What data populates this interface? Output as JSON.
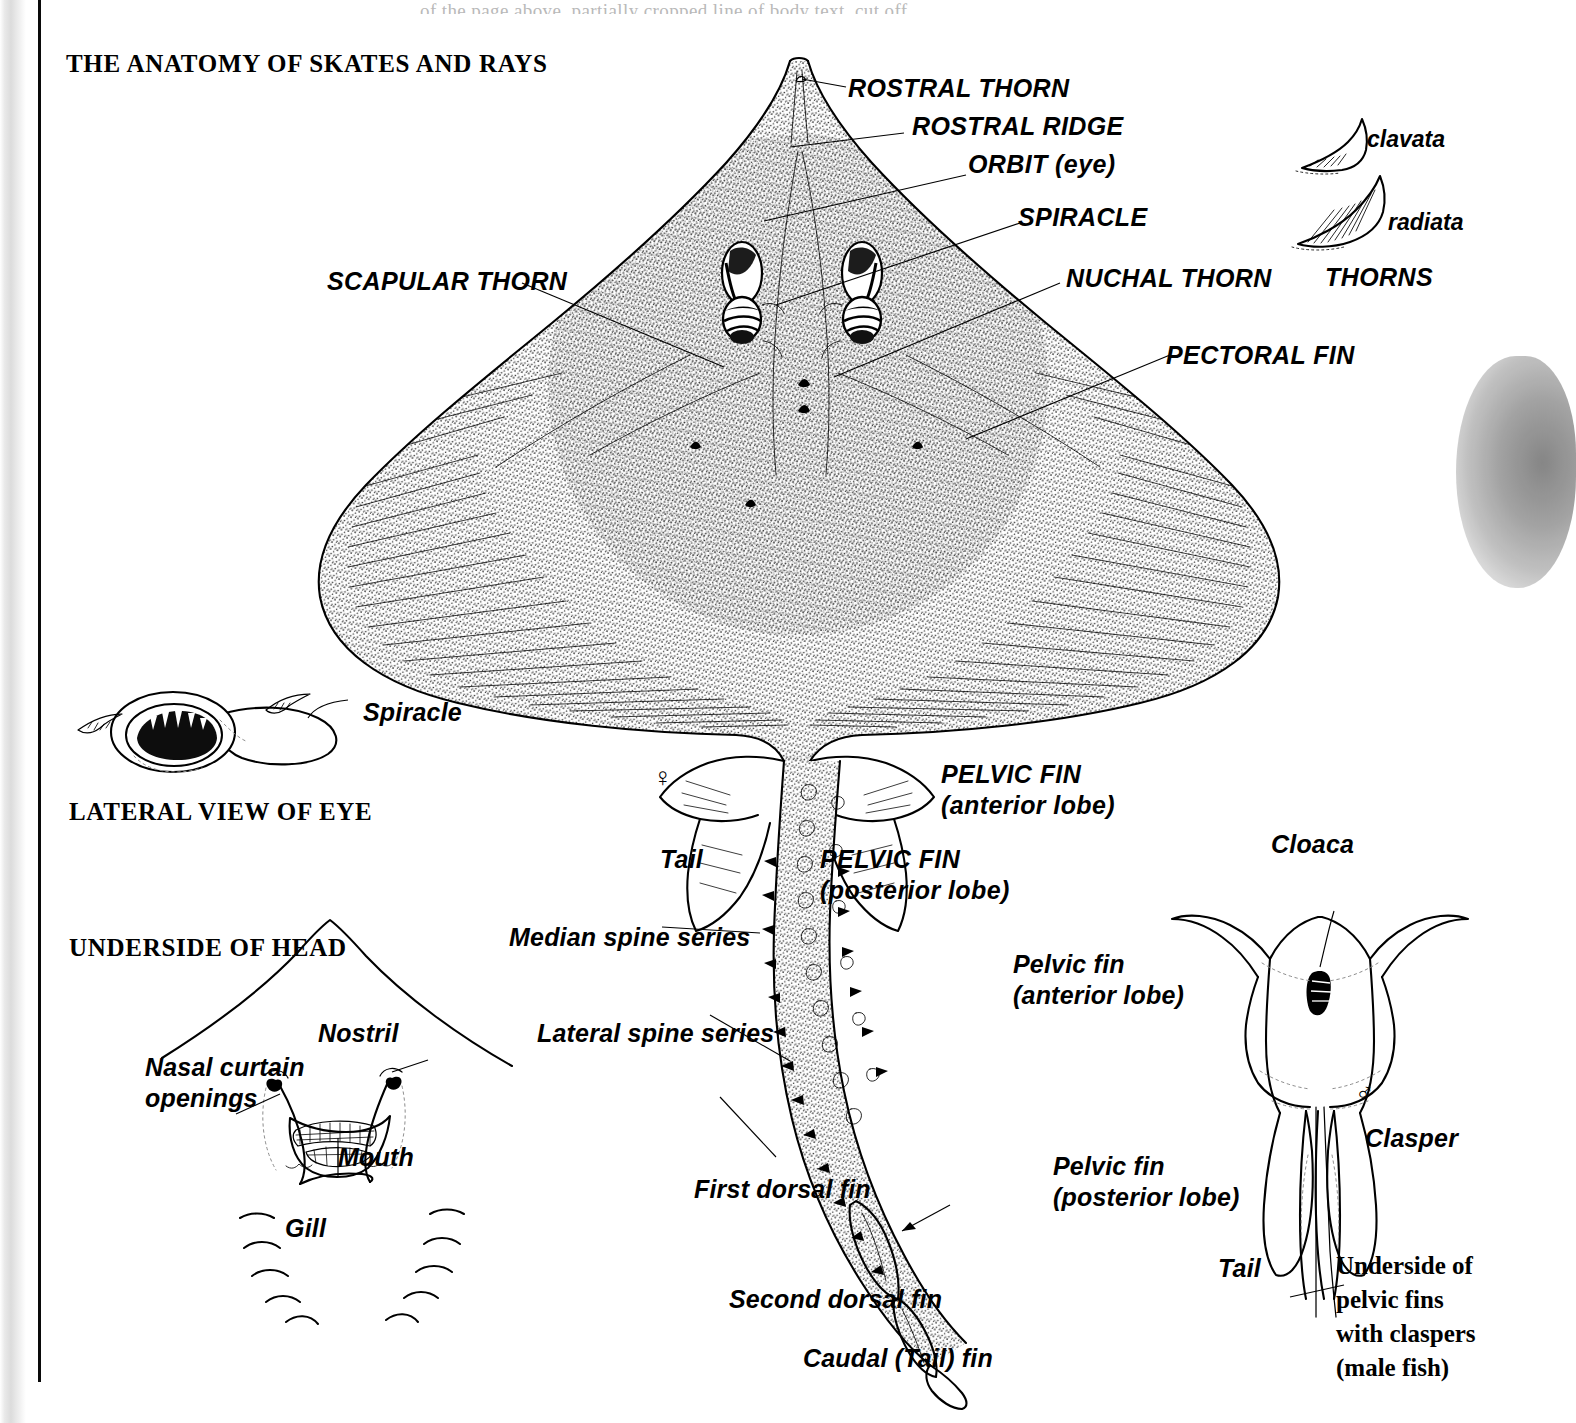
{
  "page": {
    "title": "THE ANATOMY OF SKATES AND RAYS",
    "top_text_ghost": "of the page above, partially cropped line of body text, cut off"
  },
  "dorsal_view": {
    "labels": [
      {
        "key": "rostral_thorn",
        "text": "ROSTRAL THORN"
      },
      {
        "key": "rostral_ridge",
        "text": "ROSTRAL RIDGE"
      },
      {
        "key": "orbit",
        "text": "ORBIT (eye)"
      },
      {
        "key": "spiracle",
        "text": "SPIRACLE"
      },
      {
        "key": "nuchal_thorn",
        "text": "NUCHAL THORN"
      },
      {
        "key": "pectoral_fin",
        "text": "PECTORAL FIN"
      },
      {
        "key": "scapular_thorn",
        "text": "SCAPULAR THORN"
      }
    ],
    "female_symbol": "♀"
  },
  "thorns_panel": {
    "heading": "THORNS",
    "items": [
      {
        "key": "clavata",
        "label": "clavata"
      },
      {
        "key": "radiata",
        "label": "radiata"
      }
    ]
  },
  "lateral_eye": {
    "heading": "LATERAL VIEW OF EYE",
    "labels": [
      {
        "key": "spiracle",
        "text": "Spiracle"
      }
    ]
  },
  "underside_head": {
    "heading": "UNDERSIDE OF HEAD",
    "labels": [
      {
        "key": "nasal_curtain",
        "line1": "Nasal curtain",
        "line2": "openings"
      },
      {
        "key": "nostril",
        "text": "Nostril"
      },
      {
        "key": "mouth",
        "text": "Mouth"
      },
      {
        "key": "gill",
        "text": "Gill"
      }
    ],
    "gill_count_per_side": 5
  },
  "tail_labels": {
    "tail": "Tail",
    "pelvic_fin_anterior_l1": "PELVIC FIN",
    "pelvic_fin_anterior_l2": "(anterior lobe)",
    "pelvic_fin_posterior_l1": "PELVIC FIN",
    "pelvic_fin_posterior_l2": "(posterior lobe)",
    "median_spine_series": "Median spine series",
    "lateral_spine_series": "Lateral spine series",
    "first_dorsal_fin": "First dorsal fin",
    "second_dorsal_fin": "Second dorsal fin",
    "caudal_fin": "Caudal (Tail) fin"
  },
  "claspers_panel": {
    "cloaca": "Cloaca",
    "pelvic_fin_anterior_l1": "Pelvic fin",
    "pelvic_fin_anterior_l2": "(anterior lobe)",
    "pelvic_fin_posterior_l1": "Pelvic fin",
    "pelvic_fin_posterior_l2": "(posterior lobe)",
    "tail": "Tail",
    "clasper": "Clasper",
    "male_symbol": "♂",
    "caption_l1": "Underside of",
    "caption_l2": "pelvic fins",
    "caption_l3": "with claspers",
    "caption_l4": "(male fish)"
  }
}
